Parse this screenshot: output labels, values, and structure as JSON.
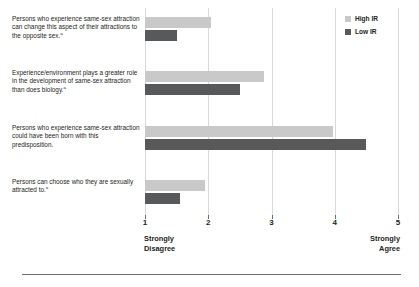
{
  "legend": {
    "position": "top-right",
    "entries": [
      {
        "label": "High IR",
        "color": "#c9c9c9"
      },
      {
        "label": "Low IR",
        "color": "#58595b"
      }
    ]
  },
  "axis": {
    "ticks": [
      "1",
      "2",
      "3",
      "4",
      "5"
    ],
    "low_anchor_line1": "Strongly",
    "low_anchor_line2": "Disagree",
    "high_anchor_line1": "Strongly",
    "high_anchor_line2": "Agree"
  },
  "rows": [
    {
      "text": "Persons who experience same-sex attraction can change this aspect of their attractions to the opposite sex.",
      "footnote": "a"
    },
    {
      "text": "Experience/environment plays a greater role in the development of same-sex attraction than does biology.",
      "footnote": "a"
    },
    {
      "text": "Persons who experience same-sex attraction could have been born with this predisposition.",
      "footnote": ""
    },
    {
      "text": "Persons can choose who they are sexually attracted to.",
      "footnote": "a"
    }
  ],
  "chart_data": {
    "type": "bar",
    "orientation": "horizontal",
    "title": "",
    "xlabel": "",
    "ylabel": "",
    "xlim": [
      1,
      5
    ],
    "xticks": [
      1,
      2,
      3,
      4,
      5
    ],
    "grid": true,
    "legend_position": "top-right",
    "categories": [
      "Persons who experience same-sex attraction can change this aspect of their attractions to the opposite sex.",
      "Experience/environment plays a greater role in the development of same-sex attraction than does biology.",
      "Persons who experience same-sex attraction could have been born with this predisposition.",
      "Persons can choose who they are sexually attracted to."
    ],
    "series": [
      {
        "name": "High IR",
        "color": "#c9c9c9",
        "values": [
          2.05,
          2.88,
          3.97,
          1.95
        ]
      },
      {
        "name": "Low IR",
        "color": "#58595b",
        "values": [
          1.5,
          2.5,
          4.5,
          1.55
        ]
      }
    ],
    "scale_anchor_low": "Strongly Disagree",
    "scale_anchor_high": "Strongly Agree"
  }
}
